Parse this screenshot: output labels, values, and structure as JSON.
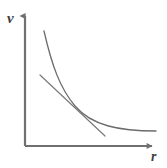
{
  "figure": {
    "kind": "line-chart",
    "background_color": "#ffffff",
    "width": 167,
    "height": 168
  },
  "axes": {
    "y_axis": {
      "label": "v",
      "label_name": "velocity",
      "arrow": true,
      "color": "#707070",
      "x": 25,
      "y_top": 12,
      "y_bottom": 146
    },
    "x_axis": {
      "label": "r",
      "label_name": "radius",
      "arrow": true,
      "color": "#707070",
      "y": 146,
      "x_left": 25,
      "x_right": 156
    },
    "origin": {
      "x": 25,
      "y": 146
    },
    "ticks": [],
    "gridlines": false
  },
  "curve": {
    "name": "inverse-decay-curve",
    "description": "v decreases hyperbolically as r increases",
    "color": "#6b6b6b",
    "stroke_width": 1.3,
    "path": "M 44 31 C 52 66, 60 88, 75 106 C 92 126, 120 131, 156 131"
  },
  "tangent": {
    "name": "tangent-line",
    "description": "straight tangent touching the curve at the inflection region",
    "color": "#7a7a7a",
    "stroke_width": 1.2,
    "x1": 40,
    "y1": 75,
    "x2": 105,
    "y2": 136,
    "tangent_point": {
      "x": 72,
      "y": 103
    }
  },
  "chart_data": {
    "type": "line",
    "title": "",
    "subtitle": "",
    "xlabel": "r",
    "ylabel": "v",
    "xlim": [
      0,
      10
    ],
    "ylim": [
      0,
      10
    ],
    "grid": false,
    "legend": null,
    "annotations": [
      {
        "name": "tangent-line",
        "type": "line",
        "text": "",
        "x": [
          1.2,
          6.3
        ],
        "y": [
          6.2,
          1.6
        ]
      }
    ],
    "series": [
      {
        "name": "v(r)",
        "type": "curve",
        "x": [
          1.5,
          2.0,
          2.5,
          3.0,
          3.5,
          4.0,
          4.5,
          5.0,
          5.5,
          6.0,
          6.5,
          7.0,
          7.5,
          8.0,
          8.5,
          9.0,
          9.5,
          10.0
        ],
        "y": [
          8.7,
          6.6,
          5.3,
          4.4,
          3.8,
          3.3,
          2.95,
          2.65,
          2.4,
          2.2,
          2.05,
          1.9,
          1.8,
          1.7,
          1.62,
          1.55,
          1.5,
          1.45
        ]
      }
    ]
  }
}
